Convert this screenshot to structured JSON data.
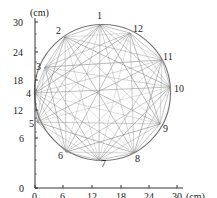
{
  "figure": {
    "caption": "(b)",
    "x_unit": "(cm)",
    "y_unit": "(cm)",
    "x_ticks": [
      "0",
      "6",
      "12",
      "18",
      "24",
      "30"
    ],
    "y_ticks": [
      "0",
      "6",
      "12",
      "18",
      "24",
      "30"
    ],
    "line_color": "#8a8a8a",
    "nodes": [
      {
        "id": "1",
        "x": 100,
        "y": 25,
        "lx": 97,
        "ly": 19
      },
      {
        "id": "2",
        "x": 65,
        "y": 37,
        "lx": 56,
        "ly": 34
      },
      {
        "id": "3",
        "x": 45,
        "y": 67,
        "lx": 36,
        "ly": 70
      },
      {
        "id": "4",
        "x": 35,
        "y": 93,
        "lx": 26,
        "ly": 97
      },
      {
        "id": "5",
        "x": 37,
        "y": 122,
        "lx": 29,
        "ly": 127
      },
      {
        "id": "6",
        "x": 66,
        "y": 152,
        "lx": 58,
        "ly": 159
      },
      {
        "id": "7",
        "x": 99,
        "y": 160,
        "lx": 101,
        "ly": 167
      },
      {
        "id": "8",
        "x": 134,
        "y": 153,
        "lx": 135,
        "ly": 162
      },
      {
        "id": "9",
        "x": 160,
        "y": 124,
        "lx": 163,
        "ly": 132
      },
      {
        "id": "10",
        "x": 170,
        "y": 87,
        "lx": 174,
        "ly": 92
      },
      {
        "id": "11",
        "x": 162,
        "y": 60,
        "lx": 163,
        "ly": 60
      },
      {
        "id": "12",
        "x": 130,
        "y": 33,
        "lx": 133,
        "ly": 32
      }
    ]
  }
}
